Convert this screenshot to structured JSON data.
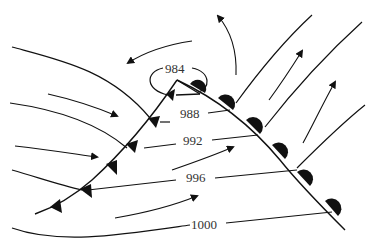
{
  "diagram": {
    "type": "mid-latitude cyclone weather map",
    "low_center": {
      "label": "984"
    },
    "isobars": [
      {
        "label": "984"
      },
      {
        "label": "988"
      },
      {
        "label": "992"
      },
      {
        "label": "996"
      },
      {
        "label": "1000"
      }
    ],
    "fronts": [
      {
        "name": "cold front",
        "symbol": "triangles"
      },
      {
        "name": "warm front",
        "symbol": "semicircles"
      }
    ],
    "colors": {
      "ink": "#111111",
      "label": "#333333",
      "background": "#ffffff"
    }
  }
}
